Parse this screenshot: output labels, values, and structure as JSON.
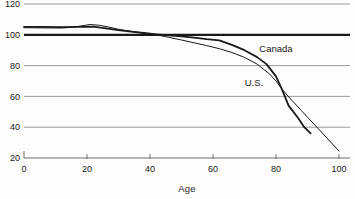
{
  "colors": {
    "background": "#fefdfb",
    "line": "#1a1a1a",
    "grid": "#8f8f8f",
    "axis": "#6e6e6e",
    "text": "#1b1b1b"
  },
  "chart_data": {
    "type": "line",
    "title": "",
    "xlabel": "Age",
    "ylabel": "",
    "xlim": [
      0,
      105
    ],
    "ylim": [
      20,
      120
    ],
    "x_ticks": [
      0,
      20,
      40,
      60,
      80,
      100
    ],
    "y_ticks": [
      120,
      100,
      80,
      60,
      40,
      20
    ],
    "grid": "horizontal",
    "reference_line": {
      "value": 100,
      "style": "bold"
    },
    "series": [
      {
        "name": "Canada",
        "style": "thick",
        "points": [
          [
            0,
            105.2
          ],
          [
            6,
            105.1
          ],
          [
            12,
            105.0
          ],
          [
            17,
            105.2
          ],
          [
            22,
            105.3
          ],
          [
            26,
            104.2
          ],
          [
            30,
            103.0
          ],
          [
            34,
            102.0
          ],
          [
            38,
            101.2
          ],
          [
            42,
            100.3
          ],
          [
            46,
            99.6
          ],
          [
            50,
            99.0
          ],
          [
            54,
            98.2
          ],
          [
            58,
            97.2
          ],
          [
            62,
            96.4
          ],
          [
            66,
            93.5
          ],
          [
            70,
            90.0
          ],
          [
            74,
            85.5
          ],
          [
            77,
            81.0
          ],
          [
            80,
            73.0
          ],
          [
            82,
            64.0
          ],
          [
            84,
            54.0
          ],
          [
            87,
            46.0
          ],
          [
            89,
            40.0
          ],
          [
            91,
            36.0
          ]
        ]
      },
      {
        "name": "U.S.",
        "style": "thin",
        "points": [
          [
            0,
            104.6
          ],
          [
            6,
            104.5
          ],
          [
            12,
            104.4
          ],
          [
            15,
            104.8
          ],
          [
            18,
            105.7
          ],
          [
            21,
            106.7
          ],
          [
            24,
            106.2
          ],
          [
            27,
            105.0
          ],
          [
            30,
            103.6
          ],
          [
            34,
            102.3
          ],
          [
            38,
            101.2
          ],
          [
            42,
            100.0
          ],
          [
            46,
            98.4
          ],
          [
            50,
            96.6
          ],
          [
            54,
            94.8
          ],
          [
            58,
            93.0
          ],
          [
            62,
            91.0
          ],
          [
            66,
            88.5
          ],
          [
            70,
            85.3
          ],
          [
            74,
            81.0
          ],
          [
            78,
            74.5
          ],
          [
            80,
            70.0
          ],
          [
            82,
            64.5
          ],
          [
            85,
            57.5
          ],
          [
            88,
            51.0
          ],
          [
            90,
            46.5
          ],
          [
            95,
            35.5
          ],
          [
            100,
            24.5
          ]
        ]
      }
    ],
    "annotations": [
      {
        "text": "Canada",
        "age": 80,
        "value": 91
      },
      {
        "text": "U.S.",
        "age": 73,
        "value": 69
      }
    ]
  }
}
